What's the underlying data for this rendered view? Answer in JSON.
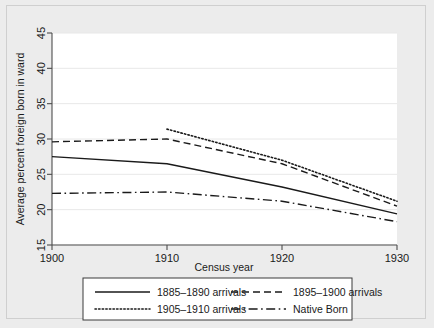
{
  "chart_data": {
    "type": "line",
    "title": "",
    "xlabel": "Census year",
    "ylabel": "Average percent foreign born in ward",
    "xlim": [
      1900,
      1930
    ],
    "ylim": [
      15,
      45
    ],
    "xticks": [
      1900,
      1910,
      1920,
      1930
    ],
    "yticks": [
      15,
      20,
      25,
      30,
      35,
      40,
      45
    ],
    "xtick_labels": [
      "1900",
      "1910",
      "1920",
      "1930"
    ],
    "ytick_labels": [
      "15",
      "20",
      "25",
      "30",
      "35",
      "40",
      "45"
    ],
    "grid": "horizontal",
    "legend_position": "below-plot",
    "x": [
      1900,
      1910,
      1920,
      1930
    ],
    "series": [
      {
        "name": "1885–1890 arrivals",
        "style": "solid",
        "color": "#1a1a1a",
        "x": [
          1900,
          1910,
          1920,
          1930
        ],
        "values": [
          27.5,
          26.5,
          23.2,
          19.4
        ]
      },
      {
        "name": "1895–1900 arrivals",
        "style": "dashed",
        "color": "#1a1a1a",
        "x": [
          1900,
          1910,
          1920,
          1930
        ],
        "values": [
          29.6,
          30.0,
          26.5,
          20.5
        ]
      },
      {
        "name": "1905–1910 arrivals",
        "style": "dotted",
        "color": "#1a1a1a",
        "x": [
          1910,
          1920,
          1930
        ],
        "values": [
          31.4,
          27.0,
          21.2
        ]
      },
      {
        "name": "Native Born",
        "style": "dash-dot",
        "color": "#1a1a1a",
        "x": [
          1900,
          1910,
          1920,
          1930
        ],
        "values": [
          22.3,
          22.5,
          21.2,
          18.3
        ]
      }
    ]
  },
  "legend": {
    "entries": [
      {
        "label": "1885–1890 arrivals",
        "style": "solid"
      },
      {
        "label": "1895–1900 arrivals",
        "style": "dashed"
      },
      {
        "label": "1905–1910 arrivals",
        "style": "dotted"
      },
      {
        "label": "Native Born",
        "style": "dash-dot"
      }
    ]
  },
  "colors": {
    "page_background": "#ececec",
    "plot_background": "#ffffff",
    "axis": "#4d4d4d",
    "grid": "#e8e8e8",
    "line": "#1a1a1a",
    "frame_border": "#cfcfcf"
  }
}
